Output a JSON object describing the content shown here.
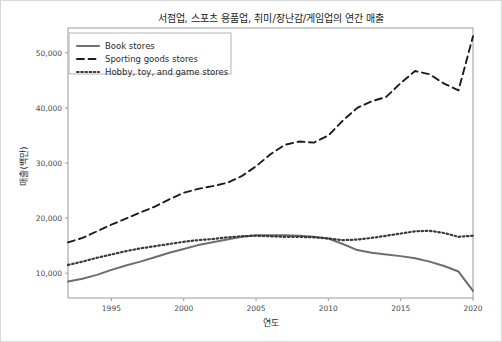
{
  "figure": {
    "title": "서점업, 스포츠 용품업, 취미/장난감/게임업의 연간 매출",
    "border_color": "#d8d8d8",
    "background": "#ffffff"
  },
  "axes": {
    "x_label": "연도",
    "y_label": "매출(백만)",
    "x_ticks": [
      "1995",
      "2000",
      "2005",
      "2010",
      "2015",
      "2020"
    ],
    "y_ticks": [
      "10,000",
      "20,000",
      "30,000",
      "40,000",
      "50,000"
    ]
  },
  "legend": {
    "position": "upper-left",
    "items": [
      {
        "label": "Book stores",
        "style": "solid",
        "color": "#6e6e6e"
      },
      {
        "label": "Sporting goods stores",
        "style": "dashed",
        "color": "#1c1c1c"
      },
      {
        "label": "Hobby, toy, and game stores",
        "style": "dotted",
        "color": "#3a3a3a"
      }
    ]
  },
  "chart_data": {
    "type": "line",
    "title": "서점업, 스포츠 용품업, 취미/장난감/게임업의 연간 매출",
    "xlabel": "연도",
    "ylabel": "매출(백만)",
    "xlim": [
      1992,
      2020
    ],
    "ylim": [
      5500,
      54500
    ],
    "grid": false,
    "x": [
      1992,
      1993,
      1994,
      1995,
      1996,
      1997,
      1998,
      1999,
      2000,
      2001,
      2002,
      2003,
      2004,
      2005,
      2006,
      2007,
      2008,
      2009,
      2010,
      2011,
      2012,
      2013,
      2014,
      2015,
      2016,
      2017,
      2018,
      2019,
      2020
    ],
    "series": [
      {
        "name": "Book stores",
        "style": "solid",
        "color": "#6e6e6e",
        "values": [
          8500,
          9000,
          9700,
          10600,
          11400,
          12100,
          12900,
          13700,
          14400,
          15100,
          15600,
          16100,
          16600,
          16900,
          16900,
          16900,
          16800,
          16600,
          16300,
          15300,
          14200,
          13700,
          13400,
          13100,
          12700,
          12100,
          11300,
          10300,
          6800
        ]
      },
      {
        "name": "Sporting goods stores",
        "style": "dashed",
        "color": "#1c1c1c",
        "values": [
          15600,
          16400,
          17600,
          18800,
          19900,
          21000,
          22100,
          23400,
          24600,
          25300,
          25800,
          26400,
          27600,
          29400,
          31600,
          33300,
          33900,
          33700,
          35000,
          37700,
          40000,
          41200,
          42000,
          44500,
          46700,
          46100,
          44400,
          43200,
          53000
        ]
      },
      {
        "name": "Hobby, toy, and game stores",
        "style": "dotted",
        "color": "#3a3a3a",
        "values": [
          11500,
          12100,
          12800,
          13400,
          14000,
          14500,
          14900,
          15300,
          15700,
          16000,
          16200,
          16500,
          16700,
          16800,
          16700,
          16600,
          16600,
          16500,
          16300,
          16000,
          16100,
          16400,
          16800,
          17200,
          17600,
          17700,
          17300,
          16600,
          16800
        ]
      }
    ]
  }
}
